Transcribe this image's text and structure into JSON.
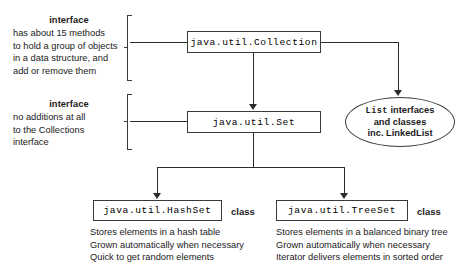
{
  "diagram": {
    "accent_color": "#2b2b2b",
    "box_border_color": "#3a3a3a",
    "background": "#ffffff"
  },
  "annotations": [
    {
      "id": "collection-note",
      "header": "interface",
      "lines": [
        "has about 15 methods",
        "to hold a group of objects",
        "in a data structure, and",
        "add or remove them"
      ]
    },
    {
      "id": "set-note",
      "header": "interface",
      "lines": [
        "no additions at all",
        "to the Collections",
        "interface"
      ]
    }
  ],
  "nodes": {
    "collection": {
      "label": "java.util.Collection",
      "kind": ""
    },
    "set": {
      "label": "java.util.Set",
      "kind": ""
    },
    "hashset": {
      "label": "java.util.HashSet",
      "kind": "class"
    },
    "treeset": {
      "label": "java.util.TreeSet",
      "kind": "class"
    }
  },
  "ellipse": {
    "id": "list-bubble",
    "line1_mono": "List",
    "line1_rest": "interfaces",
    "line2": "and classes",
    "line3": "inc. LinkedList"
  },
  "descriptions": {
    "hashset": [
      "Stores elements in a hash table",
      "Grown automatically when necessary",
      "Quick to get random elements"
    ],
    "treeset": [
      "Stores elements in a balanced binary tree",
      "Grown automatically when necessary",
      "Iterator delivers elements in sorted order"
    ]
  }
}
